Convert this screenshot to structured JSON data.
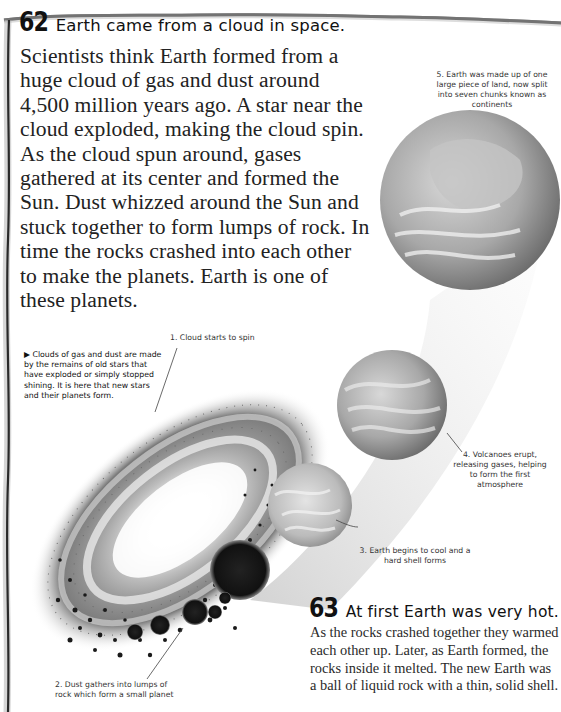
{
  "page": {
    "type": "encyclopedia page",
    "colors": {
      "text": "#1c1c1c",
      "background": "#ffffff",
      "frame": "#333333",
      "illustration": "#8a8a8a"
    }
  },
  "section62": {
    "number": "62",
    "title": "Earth came from a cloud in space.",
    "body": "Scientists think Earth formed from a huge cloud of gas and dust around 4,500 million years ago. A star near the cloud exploded, making the cloud spin. As the cloud spun around, gases gathered at its center and formed the Sun. Dust whizzed around the Sun and stuck together to form lumps of rock. In time the rocks crashed into each other to make the planets. Earth is one of these planets."
  },
  "side_note": {
    "bullet": "▶",
    "text": "Clouds of gas and dust are made by the remains of old stars that have exploded or simply stopped shining. It is here that new stars and their planets form."
  },
  "captions": [
    {
      "id": "step1",
      "number": "1.",
      "text": "Cloud starts to spin"
    },
    {
      "id": "step2",
      "number": "2.",
      "text": "Dust gathers into lumps of rock which form a small planet"
    },
    {
      "id": "step3",
      "number": "3.",
      "text": "Earth begins to cool and a hard shell forms"
    },
    {
      "id": "step4",
      "number": "4.",
      "text": "Volcanoes erupt, releasing gases, helping to form the first atmosphere"
    },
    {
      "id": "step5",
      "number": "5.",
      "text": "Earth was made up of one large piece of land, now split into seven chunks known as continents"
    }
  ],
  "section63": {
    "number": "63",
    "title": "At first Earth was very hot.",
    "body": "As the rocks crashed together they warmed each other up. Later, as Earth formed, the rocks inside it melted. The new Earth was a ball of liquid rock with a thin, solid shell."
  }
}
